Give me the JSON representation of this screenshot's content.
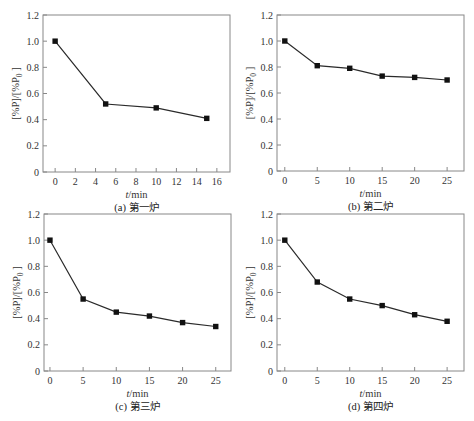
{
  "chart_data": [
    {
      "type": "line",
      "panel": "a",
      "caption": "(a) 第一炉",
      "xlabel_italic": "t",
      "xlabel_rest": "/min",
      "ylabel": "[%P]/[%P0]",
      "ylabel_main": "[%P]/[%P",
      "ylabel_sub": "0",
      "ylabel_end": "]",
      "x": [
        0,
        5,
        10,
        15
      ],
      "values": [
        1.0,
        0.52,
        0.49,
        0.41
      ],
      "xticks": [
        0,
        2,
        4,
        6,
        8,
        10,
        12,
        14,
        16
      ],
      "yticks": [
        0,
        0.2,
        0.4,
        0.6,
        0.8,
        1.0,
        1.2
      ],
      "ytick_labels": [
        "0",
        "0.2",
        "0.4",
        "0.6",
        "0.8",
        "1.0",
        "1.2"
      ],
      "xlim": [
        -1.2,
        17.3
      ],
      "ylim": [
        0,
        1.2
      ],
      "grid": false,
      "marker": "square"
    },
    {
      "type": "line",
      "panel": "b",
      "caption": "(b) 第二炉",
      "xlabel_italic": "t",
      "xlabel_rest": "/min",
      "ylabel": "[%P]/[%P0]",
      "ylabel_main": "[%P]/[%P",
      "ylabel_sub": "0",
      "ylabel_end": "]",
      "x": [
        0,
        5,
        10,
        15,
        20,
        25
      ],
      "values": [
        1.0,
        0.81,
        0.79,
        0.73,
        0.72,
        0.7
      ],
      "xticks": [
        0,
        5,
        10,
        15,
        20,
        25
      ],
      "yticks": [
        0,
        0.2,
        0.4,
        0.6,
        0.8,
        1.0,
        1.2
      ],
      "ytick_labels": [
        "0",
        "0.2",
        "0.4",
        "0.6",
        "0.8",
        "1.0",
        "1.2"
      ],
      "xlim": [
        -1.2,
        27.6
      ],
      "ylim": [
        0,
        1.2
      ],
      "grid": false,
      "marker": "square"
    },
    {
      "type": "line",
      "panel": "c",
      "caption": "(c) 第三炉",
      "xlabel_italic": "t",
      "xlabel_rest": "/min",
      "ylabel": "[%P]/[%P0]",
      "ylabel_main": "[%P]/[%P",
      "ylabel_sub": "0",
      "ylabel_end": "]",
      "x": [
        0,
        5,
        10,
        15,
        20,
        25
      ],
      "values": [
        1.0,
        0.55,
        0.45,
        0.42,
        0.37,
        0.34
      ],
      "xticks": [
        0,
        5,
        10,
        15,
        20,
        25
      ],
      "yticks": [
        0,
        0.2,
        0.4,
        0.6,
        0.8,
        1.0,
        1.2
      ],
      "ytick_labels": [
        "0",
        "0.2",
        "0.4",
        "0.6",
        "0.8",
        "1.0",
        "1.2"
      ],
      "xlim": [
        -0.9,
        27.3
      ],
      "ylim": [
        0,
        1.2
      ],
      "grid": false,
      "marker": "square"
    },
    {
      "type": "line",
      "panel": "d",
      "caption": "(d) 第四炉",
      "xlabel_italic": "t",
      "xlabel_rest": "/min",
      "ylabel": "[%P]/[%P0]",
      "ylabel_main": "[%P]/[%P",
      "ylabel_sub": "0",
      "ylabel_end": "]",
      "x": [
        0,
        5,
        10,
        15,
        20,
        25
      ],
      "values": [
        1.0,
        0.68,
        0.55,
        0.5,
        0.43,
        0.38
      ],
      "xticks": [
        0,
        5,
        10,
        15,
        20,
        25
      ],
      "yticks": [
        0,
        0.2,
        0.4,
        0.6,
        0.8,
        1.0,
        1.2
      ],
      "ytick_labels": [
        "0",
        "0.2",
        "0.4",
        "0.6",
        "0.8",
        "1.0",
        "1.2"
      ],
      "xlim": [
        -1.2,
        27.6
      ],
      "ylim": [
        0,
        1.2
      ],
      "grid": false,
      "marker": "square"
    }
  ],
  "colors": {
    "line": "#2a2a2a",
    "marker": "#111111",
    "frame": "#888888",
    "text": "#333333"
  }
}
